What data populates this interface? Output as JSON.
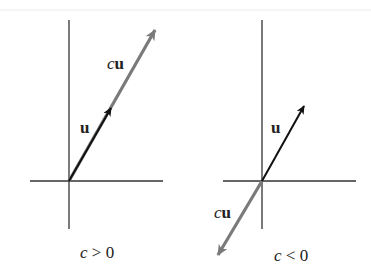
{
  "diagram": {
    "colors": {
      "axis": "#333333",
      "vector_u": "#111111",
      "vector_cu": "#7a7a7a",
      "top_rule": "#e8e8e8"
    },
    "panels": [
      {
        "caption_c": "c",
        "caption_rel": " > 0",
        "label_u": "u",
        "label_cu_c": "c",
        "label_cu_u": "u"
      },
      {
        "caption_c": "c",
        "caption_rel": " < 0",
        "label_u": "u",
        "label_cu_c": "c",
        "label_cu_u": "u"
      }
    ]
  }
}
